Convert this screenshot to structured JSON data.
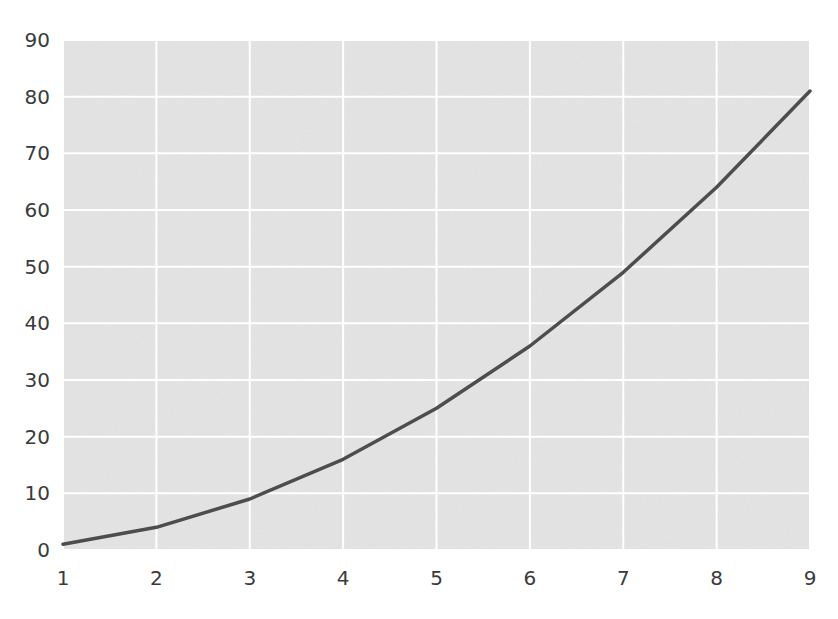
{
  "chart_data": {
    "type": "line",
    "title": "",
    "xlabel": "",
    "ylabel": "",
    "x": [
      1,
      2,
      3,
      4,
      5,
      6,
      7,
      8,
      9
    ],
    "series": [
      {
        "name": "y = x^2",
        "values": [
          1,
          4,
          9,
          16,
          25,
          36,
          49,
          64,
          81
        ],
        "color": "#4d4d4d"
      }
    ],
    "xlim": [
      1,
      9
    ],
    "ylim": [
      0,
      90
    ],
    "xticks": [
      1,
      2,
      3,
      4,
      5,
      6,
      7,
      8,
      9
    ],
    "yticks": [
      0,
      10,
      20,
      30,
      40,
      50,
      60,
      70,
      80,
      90
    ],
    "grid": true,
    "legend": null,
    "style": {
      "background": "#e6e6e6",
      "grid_color": "#ffffff",
      "tick_color": "#3a3a3a"
    }
  }
}
